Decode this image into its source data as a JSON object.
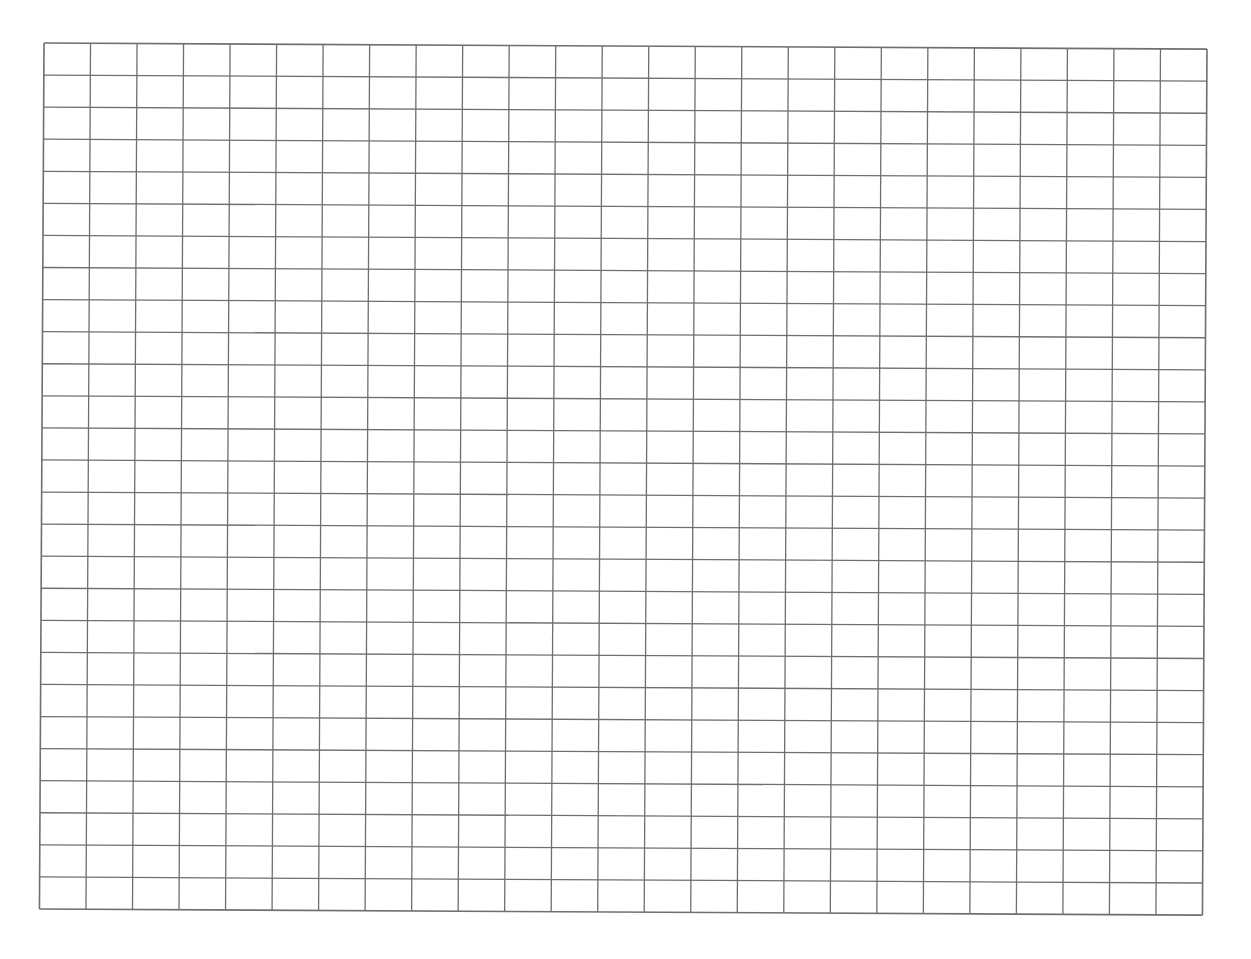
{
  "page": {
    "background": "#ffffff"
  },
  "grid": {
    "columns": 25,
    "rows": 27,
    "width_px": 1163,
    "height_px": 866,
    "line_color": "#6f6f6f",
    "line_width": 1.3,
    "border_width": 1.6,
    "rotation_deg": 0.3
  }
}
